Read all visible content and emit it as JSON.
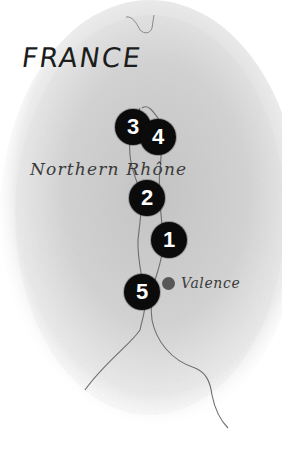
{
  "map": {
    "country_label": "FRANCE",
    "region_label": "Northern Rhône",
    "city": {
      "name": "Valence",
      "dot_color": "#575757"
    },
    "markers": [
      {
        "number": "1",
        "x": 169,
        "y": 240
      },
      {
        "number": "2",
        "x": 147,
        "y": 198
      },
      {
        "number": "3",
        "x": 133,
        "y": 127
      },
      {
        "number": "4",
        "x": 158,
        "y": 137
      },
      {
        "number": "5",
        "x": 142,
        "y": 292
      }
    ],
    "colors": {
      "marker_fill": "#0b0b0b",
      "marker_text": "#ffffff",
      "land_shade": "#cfcfcf",
      "river": "#6e6e6e"
    }
  }
}
